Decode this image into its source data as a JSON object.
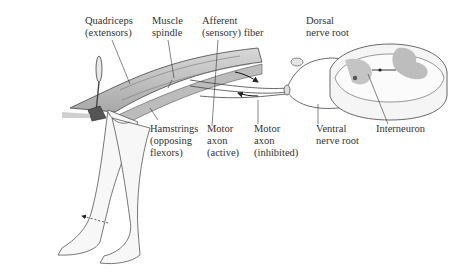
{
  "figure": {
    "labels": {
      "quadriceps": [
        "Quadriceps",
        "(extensors)"
      ],
      "muscle_spindle": [
        "Muscle",
        "spindle"
      ],
      "afferent_fiber": [
        "Afferent",
        "(sensory) fiber"
      ],
      "dorsal_root": [
        "Dorsal",
        "nerve root"
      ],
      "hamstrings": [
        "Hamstrings",
        "(opposing",
        "flexors)"
      ],
      "motor_axon_active": [
        "Motor",
        "axon",
        "(active)"
      ],
      "motor_axon_inhibited": [
        "Motor",
        "axon",
        "(inhibited)"
      ],
      "ventral_root": [
        "Ventral",
        "nerve root"
      ],
      "interneuron": [
        "Interneuron"
      ]
    },
    "colors": {
      "line": "#3a3a3a",
      "muscle_fill": "#c9c9c9",
      "grey_matter": "#b5b5b5",
      "skin": "#f4f4f4"
    }
  }
}
